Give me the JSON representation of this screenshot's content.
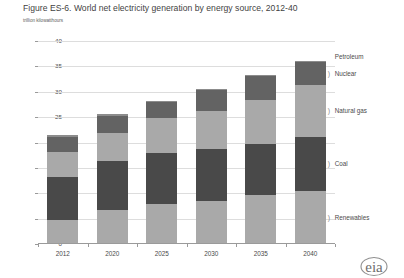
{
  "figure": {
    "title": "Figure ES-6.  World net electricity generation by energy source, 2012-40",
    "subtitle": "trillion kilowatthours",
    "logo_text": "eia"
  },
  "chart_data": {
    "type": "bar",
    "stacked": true,
    "title": "Figure ES-6.  World net electricity generation by energy source, 2012-40",
    "subtitle": "trillion kilowatthours",
    "xlabel": "",
    "ylabel": "trillion kilowatthours",
    "ylim": [
      0,
      40
    ],
    "ytick_labels": [
      "0",
      "5",
      "10",
      "15",
      "20",
      "25",
      "30",
      "35",
      "40"
    ],
    "yticks": [
      0,
      5,
      10,
      15,
      20,
      25,
      30,
      35,
      40
    ],
    "grid": true,
    "legend_position": "right-inline",
    "categories": [
      "2012",
      "2020",
      "2025",
      "2030",
      "2035",
      "2040"
    ],
    "series": [
      {
        "name": "Renewables",
        "color": "#a9a9a9",
        "values": [
          4.7,
          6.8,
          7.8,
          8.5,
          9.6,
          10.4
        ]
      },
      {
        "name": "Coal",
        "color": "#494949",
        "values": [
          8.6,
          9.6,
          10.1,
          10.2,
          10.2,
          10.6
        ]
      },
      {
        "name": "Natural gas",
        "color": "#a9a9a9",
        "values": [
          4.8,
          5.4,
          7.0,
          7.6,
          8.6,
          10.3
        ]
      },
      {
        "name": "Nuclear",
        "color": "#636363",
        "values": [
          3.0,
          3.5,
          3.0,
          4.0,
          4.7,
          4.5
        ]
      },
      {
        "name": "Petroleum",
        "color": "#8c8c8c",
        "values": [
          0.3,
          0.3,
          0.2,
          0.2,
          0.2,
          0.2
        ]
      }
    ],
    "totals": [
      21.4,
      25.6,
      28.1,
      30.5,
      33.3,
      36.0
    ]
  },
  "legend": {
    "items": [
      {
        "label": "Petroleum"
      },
      {
        "label": "Nuclear"
      },
      {
        "label": "Natural gas"
      },
      {
        "label": "Coal"
      },
      {
        "label": "Renewables"
      }
    ]
  }
}
